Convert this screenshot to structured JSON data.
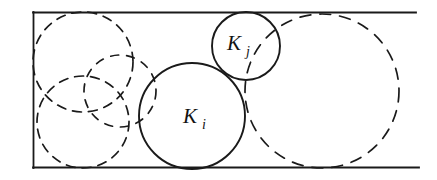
{
  "figure": {
    "kind": "circle-packing-diagram",
    "background_color": "#ffffff",
    "ink_color": "#1a1a1a",
    "container": {
      "name": "bounding-rectangle",
      "style": "solid",
      "x": 33,
      "y": 12,
      "width": 382,
      "height": 156,
      "stroke_width": 1.6
    },
    "labels": [
      {
        "id": "ki",
        "base": "K",
        "subscript": "i",
        "x": 190,
        "y": 123
      },
      {
        "id": "kj",
        "base": "K",
        "subscript": "j",
        "x": 234,
        "y": 50
      }
    ],
    "circles": [
      {
        "id": "dashed-top-left",
        "label": "",
        "style": "dashed",
        "cx": 83,
        "cy": 62,
        "r": 50
      },
      {
        "id": "dashed-bottom-left",
        "label": "",
        "style": "dashed",
        "cx": 83,
        "cy": 122,
        "r": 46
      },
      {
        "id": "dashed-middle-small",
        "label": "",
        "style": "dashed",
        "cx": 120,
        "cy": 91,
        "r": 36
      },
      {
        "id": "dashed-right-large",
        "label": "",
        "style": "dashed",
        "cx": 322,
        "cy": 91,
        "r": 77
      },
      {
        "id": "solid-ki",
        "label": "K_i",
        "style": "solid",
        "cx": 192,
        "cy": 116,
        "r": 53
      },
      {
        "id": "solid-kj",
        "label": "K_j",
        "style": "solid",
        "cx": 246,
        "cy": 46,
        "r": 34
      }
    ],
    "dash_pattern": "9 7",
    "caption": ""
  }
}
